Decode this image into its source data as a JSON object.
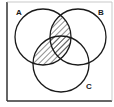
{
  "diagram": {
    "type": "venn",
    "sets": [
      {
        "label": "A",
        "cx": 43,
        "cy": 37,
        "r": 28,
        "label_x": 16,
        "label_y": 15
      },
      {
        "label": "B",
        "cx": 78,
        "cy": 37,
        "r": 28,
        "label_x": 98,
        "label_y": 15
      },
      {
        "label": "C",
        "cx": 61,
        "cy": 64,
        "r": 28,
        "label_x": 86,
        "label_y": 89
      }
    ],
    "shaded_region": "A ∩ (B ∪ C)",
    "shading_pattern": "diagonal-hatch",
    "colors": {
      "stroke": "#1a1a1a",
      "frame": "#333333",
      "background": "#ffffff",
      "hatch": "#333333"
    }
  }
}
